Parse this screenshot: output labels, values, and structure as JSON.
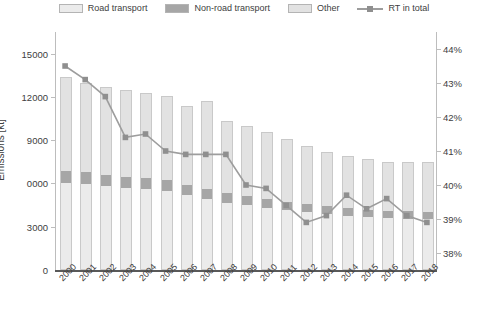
{
  "legend": {
    "items": [
      {
        "label": "Road transport",
        "type": "swatch",
        "color": "#ebebeb",
        "name": "legend-road-transport"
      },
      {
        "label": "Non-road transport",
        "type": "swatch",
        "color": "#a6a6a6",
        "name": "legend-non-road-transport"
      },
      {
        "label": "Other",
        "type": "swatch",
        "color": "#e2e2e2",
        "name": "legend-other"
      },
      {
        "label": "RT in total",
        "type": "line",
        "color": "#9d9d9d",
        "name": "legend-rt-in-total"
      }
    ]
  },
  "chart_data": {
    "type": "bar",
    "title": "",
    "xlabel": "",
    "ylabel": "Emissions [kt]",
    "y2label": "",
    "ylim": [
      0,
      16500
    ],
    "y2lim": [
      37.5,
      44.5
    ],
    "grid": false,
    "legend_position": "top",
    "categories": [
      "2000",
      "2001",
      "2002",
      "2003",
      "2004",
      "2005",
      "2006",
      "2007",
      "2008",
      "2009",
      "2010",
      "2011",
      "2012",
      "2013",
      "2014",
      "2015",
      "2016",
      "2017",
      "2018"
    ],
    "yticks": [
      0,
      3000,
      6000,
      9000,
      12000,
      15000
    ],
    "ytick_labels": [
      "0",
      "3000",
      "0000",
      "9000",
      "12000",
      "15000"
    ],
    "y2ticks": [
      38,
      39,
      40,
      41,
      42,
      43,
      44
    ],
    "y2tick_labels": [
      "38%",
      "39%",
      "40%",
      "41%",
      "42%",
      "43%",
      "44%"
    ],
    "series": [
      {
        "name": "Road transport",
        "stack": "emissions",
        "color": "#ebebeb",
        "axis": "left",
        "values": [
          6000,
          5950,
          5800,
          5700,
          5600,
          5500,
          5200,
          4900,
          4650,
          4500,
          4300,
          4150,
          4000,
          3850,
          3750,
          3650,
          3600,
          3550,
          3500
        ]
      },
      {
        "name": "Non-road transport",
        "stack": "emissions",
        "color": "#a6a6a6",
        "axis": "left",
        "values": [
          850,
          820,
          800,
          780,
          760,
          740,
          720,
          700,
          680,
          650,
          620,
          600,
          580,
          560,
          550,
          540,
          530,
          520,
          510
        ]
      },
      {
        "name": "Other",
        "stack": "emissions",
        "color": "#e2e2e2",
        "axis": "left",
        "values": [
          6550,
          6230,
          6100,
          6020,
          5940,
          5810,
          5480,
          6100,
          4970,
          4850,
          4680,
          4350,
          4020,
          3790,
          3600,
          3510,
          3370,
          3430,
          3490
        ]
      },
      {
        "name": "RT in total",
        "type": "line",
        "color": "#9d9d9d",
        "axis": "right",
        "values": [
          43.5,
          43.1,
          42.6,
          41.4,
          41.5,
          41.0,
          40.9,
          40.9,
          40.9,
          40.0,
          39.9,
          39.4,
          38.9,
          39.1,
          39.7,
          39.3,
          39.6,
          39.1,
          38.9
        ]
      }
    ],
    "totals": [
      13400,
      13000,
      12700,
      12500,
      12300,
      12050,
      11400,
      11700,
      10300,
      10000,
      9600,
      9100,
      8600,
      8200,
      7900,
      7700,
      7500,
      7500,
      7500
    ]
  }
}
